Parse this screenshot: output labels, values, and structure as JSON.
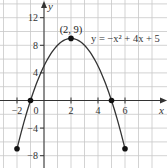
{
  "chart_data": {
    "type": "line",
    "title": "",
    "equation": "y = −x² + 4x + 5",
    "xlabel": "x",
    "ylabel": "y",
    "xlim": [
      -3,
      8.5
    ],
    "ylim": [
      -9.5,
      14
    ],
    "x_ticks": [
      {
        "value": -2,
        "label": "−2"
      },
      {
        "value": 0,
        "label": "0"
      },
      {
        "value": 2,
        "label": "2"
      },
      {
        "value": 4,
        "label": "4"
      },
      {
        "value": 6,
        "label": "6"
      }
    ],
    "y_ticks": [
      {
        "value": 12,
        "label": "12"
      },
      {
        "value": 8,
        "label": "8"
      },
      {
        "value": 4,
        "label": "4"
      },
      {
        "value": -4,
        "label": "−4"
      },
      {
        "value": -8,
        "label": "−8"
      }
    ],
    "grid": true,
    "x_grid_step": 1,
    "y_grid_step": 2,
    "domain": [
      -2,
      6
    ],
    "series": [
      {
        "name": "y = -x^2 + 4x + 5",
        "x": [
          -2,
          -1,
          0,
          1,
          2,
          3,
          4,
          5,
          6
        ],
        "values": [
          -7,
          0,
          5,
          8,
          9,
          8,
          5,
          0,
          -7
        ]
      }
    ],
    "marked_points": [
      {
        "x": -2,
        "y": -7,
        "label": ""
      },
      {
        "x": -1,
        "y": 0,
        "label": ""
      },
      {
        "x": 2,
        "y": 9,
        "label": "(2, 9)"
      },
      {
        "x": 5,
        "y": 0,
        "label": ""
      },
      {
        "x": 6,
        "y": -7,
        "label": ""
      }
    ],
    "colors": {
      "curve": "#333333",
      "grid": "#c8c8c8",
      "axis": "#333333",
      "point": "#111111"
    }
  }
}
